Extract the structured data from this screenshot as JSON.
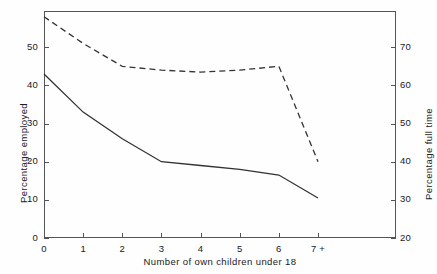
{
  "chart_data": {
    "type": "line",
    "title": "",
    "xlabel": "Number of own children under 18",
    "ylabel": "Percentage employed",
    "y2label": "Percentage full time",
    "grid": false,
    "legend": "none",
    "categories": [
      "0",
      "1",
      "2",
      "3",
      "4",
      "5",
      "6",
      "7 +"
    ],
    "x_tick_labels": [
      "0",
      "1",
      "2",
      "3",
      "4",
      "5",
      "6",
      "7 +"
    ],
    "ylim": [
      0,
      59.5
    ],
    "y_tick_labels": [
      "0",
      "10",
      "20",
      "30",
      "40",
      "50"
    ],
    "y_ticks": [
      0,
      10,
      20,
      30,
      40,
      50
    ],
    "y2lim": [
      20,
      79.5
    ],
    "y2_tick_labels": [
      "20",
      "30",
      "40",
      "50",
      "60",
      "70"
    ],
    "y2_ticks": [
      20,
      30,
      40,
      50,
      60,
      70
    ],
    "series": [
      {
        "name": "Percentage employed",
        "axis": "left",
        "style": "solid",
        "color": "#333333",
        "values": [
          43,
          33,
          26,
          20,
          19,
          18,
          16.5,
          10.5
        ]
      },
      {
        "name": "Percentage full time",
        "axis": "right",
        "style": "dashed",
        "color": "#333333",
        "values": [
          78,
          71,
          65,
          64,
          63.5,
          64,
          65,
          40
        ]
      }
    ]
  },
  "axes": {
    "left_title": "Percentage employed",
    "right_title": "Percentage full time",
    "bottom_title": "Number of own children under 18",
    "left_ticks": [
      "50",
      "40",
      "30",
      "20",
      "10",
      "0"
    ],
    "right_ticks": [
      "70",
      "60",
      "50",
      "40",
      "30",
      "20"
    ],
    "bottom_ticks": [
      "0",
      "1",
      "2",
      "3",
      "4",
      "5",
      "6",
      "7 +"
    ]
  }
}
